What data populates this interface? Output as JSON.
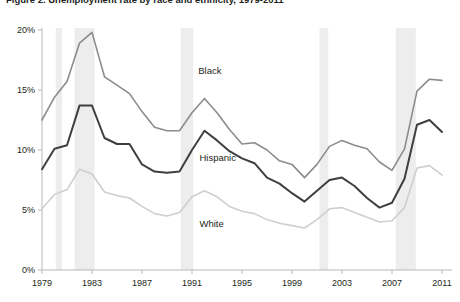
{
  "figure": {
    "title": "Figure 2. Unemployment rate by race and ethnicity, 1979-2011",
    "title_visible_note": "cropped at top edge"
  },
  "chart_data": {
    "type": "line",
    "title": "Figure 2. Unemployment rate by race and ethnicity, 1979-2011",
    "xlabel": "",
    "ylabel": "",
    "xlim": [
      1979,
      2011
    ],
    "ylim": [
      0,
      20
    ],
    "grid": false,
    "legend_position": "inline-annotations",
    "ytick_labels": [
      "0%",
      "5%",
      "10%",
      "15%",
      "20%"
    ],
    "ytick_values": [
      0,
      5,
      10,
      15,
      20
    ],
    "xtick_labels": [
      "1979",
      "1983",
      "1987",
      "1991",
      "1995",
      "1999",
      "2003",
      "2007",
      "2011"
    ],
    "xtick_values": [
      1979,
      1983,
      1987,
      1991,
      1995,
      1999,
      2003,
      2007,
      2011
    ],
    "x": [
      1979,
      1980,
      1981,
      1982,
      1983,
      1984,
      1985,
      1986,
      1987,
      1988,
      1989,
      1990,
      1991,
      1992,
      1993,
      1994,
      1995,
      1996,
      1997,
      1998,
      1999,
      2000,
      2001,
      2002,
      2003,
      2004,
      2005,
      2006,
      2007,
      2008,
      2009,
      2010,
      2011
    ],
    "series": [
      {
        "name": "Black",
        "color": "#8c8c8c",
        "width": 1.6,
        "label_x": 1991.5,
        "label_y": 16.3,
        "values": [
          12.5,
          14.4,
          15.7,
          18.9,
          19.8,
          16.1,
          15.4,
          14.7,
          13.2,
          11.9,
          11.6,
          11.6,
          13.1,
          14.3,
          13.1,
          11.7,
          10.5,
          10.6,
          10.0,
          9.1,
          8.8,
          7.7,
          8.8,
          10.3,
          10.8,
          10.4,
          10.1,
          9.0,
          8.3,
          10.1,
          14.9,
          15.9,
          15.8
        ]
      },
      {
        "name": "Hispanic",
        "color": "#3f3f3f",
        "width": 2.0,
        "label_x": 1991.6,
        "label_y": 9.1,
        "values": [
          8.4,
          10.1,
          10.4,
          13.7,
          13.7,
          11.0,
          10.5,
          10.5,
          8.8,
          8.2,
          8.1,
          8.2,
          10.0,
          11.6,
          10.8,
          9.9,
          9.3,
          8.9,
          7.7,
          7.2,
          6.4,
          5.7,
          6.6,
          7.5,
          7.7,
          7.0,
          6.0,
          5.2,
          5.6,
          7.6,
          12.1,
          12.5,
          11.5
        ]
      },
      {
        "name": "White",
        "color": "#cfcfcf",
        "width": 1.6,
        "label_x": 1991.6,
        "label_y": 3.6,
        "values": [
          5.1,
          6.3,
          6.7,
          8.4,
          8.0,
          6.5,
          6.2,
          6.0,
          5.3,
          4.7,
          4.5,
          4.8,
          6.1,
          6.6,
          6.1,
          5.3,
          4.9,
          4.7,
          4.2,
          3.9,
          3.7,
          3.5,
          4.2,
          5.1,
          5.2,
          4.8,
          4.4,
          4.0,
          4.1,
          5.2,
          8.5,
          8.7,
          7.9
        ]
      }
    ],
    "recession_bands": [
      {
        "start": 1980.1,
        "end": 1980.6
      },
      {
        "start": 1981.6,
        "end": 1983.2
      },
      {
        "start": 1990.1,
        "end": 1991.1
      },
      {
        "start": 2001.2,
        "end": 2001.9
      },
      {
        "start": 2007.3,
        "end": 2008.9
      }
    ],
    "recession_band_color": "#ededed",
    "axis_color": "#b8b8b8"
  }
}
